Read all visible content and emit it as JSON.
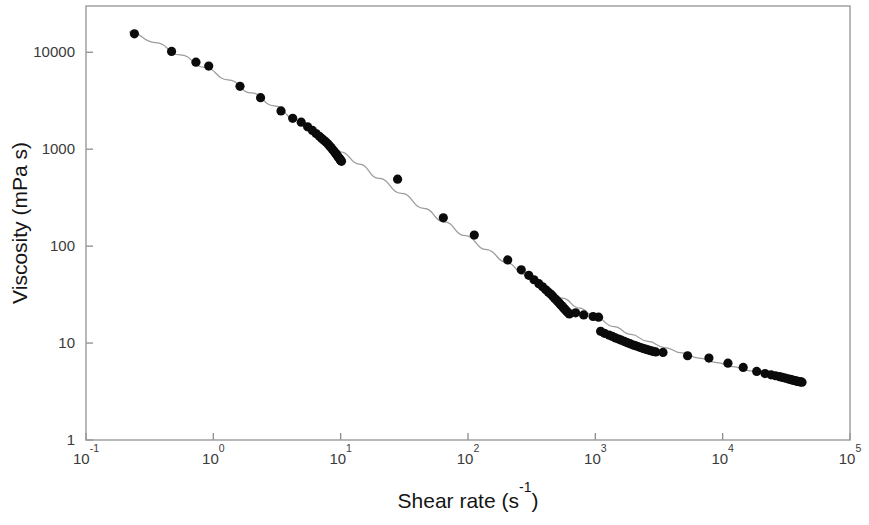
{
  "chart_data": {
    "type": "scatter",
    "title": "",
    "xlabel": "Shear rate (s-1)",
    "xlabel_base": "Shear rate (s",
    "xlabel_sup": "-1",
    "xlabel_tail": ")",
    "ylabel": "Viscosity (mPa s)",
    "xscale": "log",
    "yscale": "log",
    "xlim": [
      0.1,
      100000
    ],
    "ylim": [
      1,
      30000
    ],
    "grid": false,
    "legend": null,
    "marker_color": "#0b0b0b",
    "line_color": "#9c9c9c",
    "frame_color": "#9a9a9a",
    "background": "#ffffff",
    "xticks": [
      {
        "value": 0.1,
        "base": "10",
        "exp": "-1"
      },
      {
        "value": 1,
        "base": "10",
        "exp": "0"
      },
      {
        "value": 10,
        "base": "10",
        "exp": "1"
      },
      {
        "value": 100,
        "base": "10",
        "exp": "2"
      },
      {
        "value": 1000,
        "base": "10",
        "exp": "3"
      },
      {
        "value": 10000,
        "base": "10",
        "exp": "4"
      },
      {
        "value": 100000,
        "base": "10",
        "exp": "5"
      }
    ],
    "yticks": [
      {
        "value": 1,
        "label": "1"
      },
      {
        "value": 10,
        "label": "10"
      },
      {
        "value": 100,
        "label": "100"
      },
      {
        "value": 1000,
        "label": "1000"
      },
      {
        "value": 10000,
        "label": "10000"
      }
    ],
    "series": [
      {
        "name": "Viscosity vs shear rate",
        "marker": "filled-circle",
        "points": [
          [
            0.24,
            15500
          ],
          [
            0.47,
            10200
          ],
          [
            0.73,
            7900
          ],
          [
            0.92,
            7200
          ],
          [
            1.62,
            4450
          ],
          [
            2.35,
            3400
          ],
          [
            3.4,
            2480
          ],
          [
            4.2,
            2080
          ],
          [
            4.9,
            1900
          ],
          [
            5.5,
            1700
          ],
          [
            6.0,
            1560
          ],
          [
            6.4,
            1450
          ],
          [
            6.8,
            1360
          ],
          [
            7.1,
            1290
          ],
          [
            7.4,
            1230
          ],
          [
            7.7,
            1180
          ],
          [
            7.95,
            1130
          ],
          [
            8.2,
            1080
          ],
          [
            8.4,
            1040
          ],
          [
            8.6,
            1000
          ],
          [
            8.8,
            965
          ],
          [
            9.0,
            930
          ],
          [
            9.15,
            900
          ],
          [
            9.3,
            875
          ],
          [
            9.45,
            850
          ],
          [
            9.6,
            828
          ],
          [
            9.75,
            808
          ],
          [
            9.85,
            790
          ],
          [
            9.95,
            775
          ],
          [
            10.05,
            762
          ],
          [
            10.15,
            750
          ],
          [
            28.0,
            490
          ],
          [
            64.0,
            196
          ],
          [
            112.0,
            130
          ],
          [
            205.0,
            72
          ],
          [
            262.0,
            57
          ],
          [
            300.0,
            50
          ],
          [
            330.0,
            45
          ],
          [
            360.0,
            41
          ],
          [
            385.0,
            38
          ],
          [
            408.0,
            35.5
          ],
          [
            428.0,
            33.5
          ],
          [
            446.0,
            32
          ],
          [
            462.0,
            30.5
          ],
          [
            478.0,
            29
          ],
          [
            492.0,
            28
          ],
          [
            505.0,
            27
          ],
          [
            518.0,
            26
          ],
          [
            530.0,
            25.2
          ],
          [
            542.0,
            24.4
          ],
          [
            553.0,
            23.7
          ],
          [
            564.0,
            23
          ],
          [
            575.0,
            22.4
          ],
          [
            586.0,
            21.8
          ],
          [
            597.0,
            21.2
          ],
          [
            610.0,
            20.6
          ],
          [
            625.0,
            20.0
          ],
          [
            700.0,
            20.5
          ],
          [
            810.0,
            19.5
          ],
          [
            960.0,
            18.8
          ],
          [
            1060.0,
            18.5
          ],
          [
            1100.0,
            13.2
          ],
          [
            1180.0,
            12.6
          ],
          [
            1280.0,
            12.1
          ],
          [
            1360.0,
            11.7
          ],
          [
            1440.0,
            11.3
          ],
          [
            1520.0,
            11.0
          ],
          [
            1600.0,
            10.7
          ],
          [
            1690.0,
            10.4
          ],
          [
            1780.0,
            10.1
          ],
          [
            1870.0,
            9.85
          ],
          [
            1960.0,
            9.6
          ],
          [
            2060.0,
            9.4
          ],
          [
            2160.0,
            9.2
          ],
          [
            2260.0,
            9.0
          ],
          [
            2370.0,
            8.8
          ],
          [
            2480.0,
            8.65
          ],
          [
            2600.0,
            8.5
          ],
          [
            2720.0,
            8.35
          ],
          [
            2850.0,
            8.2
          ],
          [
            2980.0,
            8.1
          ],
          [
            3400.0,
            8.0
          ],
          [
            5300.0,
            7.4
          ],
          [
            7800.0,
            7.0
          ],
          [
            11000.0,
            6.2
          ],
          [
            14500.0,
            5.6
          ],
          [
            18500.0,
            5.1
          ],
          [
            21500.0,
            4.85
          ],
          [
            24000.0,
            4.7
          ],
          [
            26000.0,
            4.6
          ],
          [
            28000.0,
            4.5
          ],
          [
            29500.0,
            4.42
          ],
          [
            31000.0,
            4.35
          ],
          [
            32500.0,
            4.28
          ],
          [
            34000.0,
            4.22
          ],
          [
            35000.0,
            4.17
          ],
          [
            36000.0,
            4.13
          ],
          [
            37000.0,
            4.09
          ],
          [
            38000.0,
            4.05
          ],
          [
            39000.0,
            4.02
          ],
          [
            40000.0,
            4.0
          ],
          [
            41000.0,
            3.97
          ],
          [
            42000.0,
            3.95
          ]
        ]
      }
    ],
    "fit_curve": {
      "name": "Cross-model fit",
      "points": [
        [
          0.22,
          16200
        ],
        [
          0.35,
          12600
        ],
        [
          0.55,
          9400
        ],
        [
          0.85,
          7000
        ],
        [
          1.3,
          5200
        ],
        [
          2.0,
          3800
        ],
        [
          3.0,
          2800
        ],
        [
          4.5,
          2000
        ],
        [
          6.5,
          1430
        ],
        [
          9.0,
          1020
        ],
        [
          10.0,
          940
        ],
        [
          14.0,
          700
        ],
        [
          20.0,
          500
        ],
        [
          30.0,
          350
        ],
        [
          45.0,
          245
        ],
        [
          65.0,
          178
        ],
        [
          95.0,
          128
        ],
        [
          140.0,
          92
        ],
        [
          200.0,
          68
        ],
        [
          280.0,
          51
        ],
        [
          400.0,
          38
        ],
        [
          550.0,
          29
        ],
        [
          750.0,
          23
        ],
        [
          1000.0,
          18.5
        ],
        [
          1400.0,
          14.8
        ],
        [
          1900.0,
          12.3
        ],
        [
          2600.0,
          10.4
        ],
        [
          3500.0,
          9.0
        ],
        [
          4800.0,
          7.9
        ],
        [
          6500.0,
          7.0
        ],
        [
          9000.0,
          6.3
        ],
        [
          12000.0,
          5.7
        ],
        [
          16000.0,
          5.2
        ],
        [
          22000.0,
          4.8
        ],
        [
          30000.0,
          4.4
        ],
        [
          42000.0,
          4.05
        ]
      ]
    }
  }
}
